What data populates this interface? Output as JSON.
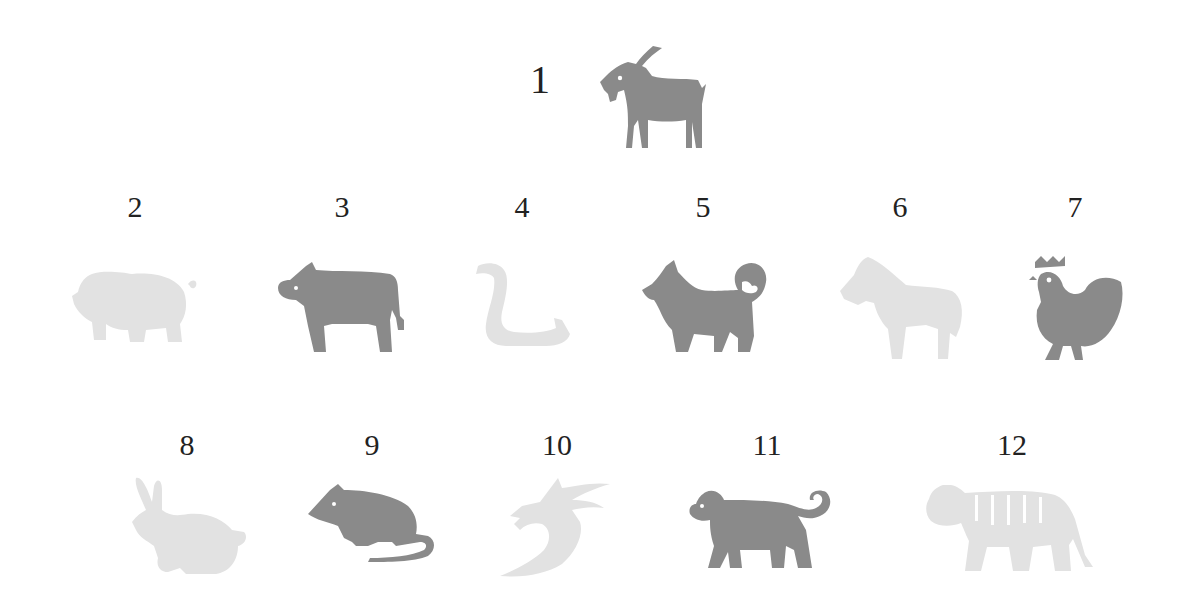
{
  "colors": {
    "active": "#8a8a8a",
    "inactive": "#e2e2e2",
    "text": "#222222"
  },
  "items": [
    {
      "number": "1",
      "animal": "goat",
      "state": "active"
    },
    {
      "number": "2",
      "animal": "pig",
      "state": "inactive"
    },
    {
      "number": "3",
      "animal": "ox",
      "state": "active"
    },
    {
      "number": "4",
      "animal": "snake",
      "state": "inactive"
    },
    {
      "number": "5",
      "animal": "dog",
      "state": "active"
    },
    {
      "number": "6",
      "animal": "horse",
      "state": "inactive"
    },
    {
      "number": "7",
      "animal": "rooster",
      "state": "active"
    },
    {
      "number": "8",
      "animal": "rabbit",
      "state": "inactive"
    },
    {
      "number": "9",
      "animal": "rat",
      "state": "active"
    },
    {
      "number": "10",
      "animal": "dragon",
      "state": "inactive"
    },
    {
      "number": "11",
      "animal": "monkey",
      "state": "active"
    },
    {
      "number": "12",
      "animal": "tiger",
      "state": "inactive"
    }
  ]
}
